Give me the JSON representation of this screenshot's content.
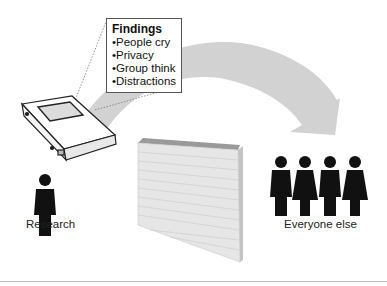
{
  "callout": {
    "title": "Findings",
    "items": [
      "People cry",
      "Privacy",
      "Group think",
      "Distractions"
    ]
  },
  "labels": {
    "left": "Research",
    "right": "Everyone else"
  },
  "colors": {
    "arrow": "#d0d0d0",
    "figure": "#111111",
    "wall_face": "#e6e6e6",
    "wall_top": "#9a9a9a",
    "divider": "#bdbdbd"
  },
  "icons": {
    "binder": "binder-icon",
    "wall": "brick-wall-icon",
    "arrow": "curved-arrow-icon",
    "person": "person-icon"
  }
}
